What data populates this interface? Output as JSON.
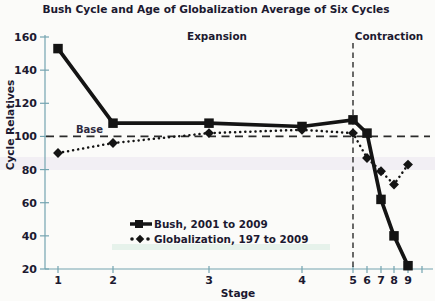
{
  "title": "Bush Cycle and Age of Globalization Average of Six Cycles",
  "annotations": {
    "expansion": "Expansion",
    "contraction": "Contraction",
    "base": "Base"
  },
  "colors": {
    "series": "#141414",
    "axis": "#74a4b0",
    "dashed": "#2b2b2b",
    "text": "#1c1930",
    "background": "#fbfbf9",
    "artifact_band": "#c9b7d8",
    "artifact_band2": "#7fc9a0"
  },
  "chart_data": {
    "type": "line",
    "title": "Bush Cycle and Age of Globalization Average of Six Cycles",
    "xlabel": "Stage",
    "ylabel": "Cycle Relatives",
    "ylim": [
      20,
      160
    ],
    "yticks": [
      20,
      40,
      60,
      80,
      100,
      120,
      140,
      160
    ],
    "grid": false,
    "baseline": 100,
    "baseline_label": "Base",
    "divider_stage": "5",
    "zones": {
      "expansion": "Expansion",
      "contraction": "Contraction"
    },
    "categories": [
      "1",
      "2",
      "3",
      "4",
      "5",
      "6",
      "7",
      "8",
      "9"
    ],
    "x_axis_ticks": [
      {
        "label": "1",
        "x": 58
      },
      {
        "label": "2",
        "x": 113
      },
      {
        "label": "3",
        "x": 209
      },
      {
        "label": "4",
        "x": 302
      },
      {
        "label": "5",
        "x": 353
      },
      {
        "label": "6",
        "x": 367
      },
      {
        "label": "7",
        "x": 381
      },
      {
        "label": "8",
        "x": 394
      },
      {
        "label": "9",
        "x": 408
      },
      {
        "label": "",
        "x": 422
      }
    ],
    "series": [
      {
        "name": "Globalization, 197 to 2009",
        "marker": "diamond",
        "line_style": "dotted",
        "values": [
          90,
          96,
          102,
          104,
          102,
          87,
          79,
          71,
          83
        ]
      },
      {
        "name": "Bush, 2001 to 2009",
        "marker": "square",
        "line_style": "solid",
        "values": [
          153,
          108,
          108,
          106,
          110,
          102,
          62,
          40,
          22
        ]
      }
    ],
    "legend_position": "bottom-center-inside"
  },
  "legend": {
    "items": [
      {
        "label": "Bush,  2001 to 2009",
        "swatch": "solid-square"
      },
      {
        "label": "Globalization, 197 to 2009",
        "swatch": "dot-diamond-dot"
      }
    ]
  }
}
